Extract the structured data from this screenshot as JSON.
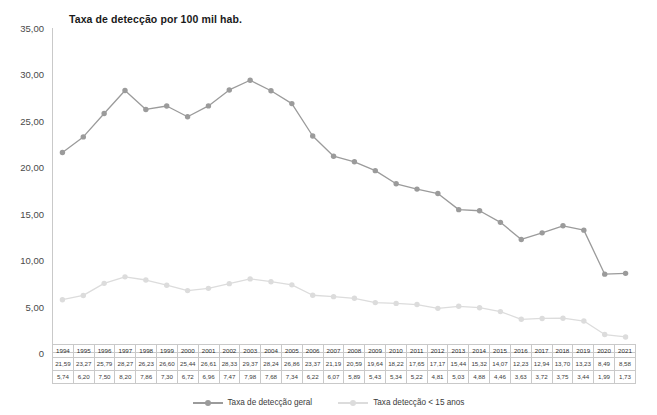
{
  "chart_data": {
    "type": "line",
    "title": "Taxa de detecção por 100 mil hab.",
    "xlabel": "",
    "ylabel": "",
    "ylim": [
      0,
      35
    ],
    "grid": false,
    "legend_position": "bottom",
    "categories": [
      "1994",
      "1995",
      "1996",
      "1997",
      "1998",
      "1999",
      "2000",
      "2001",
      "2002",
      "2003",
      "2004",
      "2005",
      "2006",
      "2007",
      "2008",
      "2009",
      "2010",
      "2011",
      "2012",
      "2013",
      "2014",
      "2015",
      "2016",
      "2017",
      "2018",
      "2019",
      "2020",
      "2021"
    ],
    "y_ticks": [
      "0",
      "5,00",
      "10,00",
      "15,00",
      "20,00",
      "25,00",
      "30,00",
      "35,00"
    ],
    "y_tick_values": [
      0,
      5,
      10,
      15,
      20,
      25,
      30,
      35
    ],
    "series": [
      {
        "name": "Taxa de detecção geral",
        "color": "#9b9b9b",
        "values": [
          21.59,
          23.27,
          25.79,
          28.27,
          26.23,
          26.6,
          25.44,
          26.61,
          28.33,
          29.37,
          28.24,
          26.86,
          23.37,
          21.19,
          20.59,
          19.64,
          18.22,
          17.65,
          17.17,
          15.44,
          15.32,
          14.07,
          12.23,
          12.94,
          13.7,
          13.23,
          8.49,
          8.58
        ],
        "labels": [
          "21,59",
          "23,27",
          "25,79",
          "28,27",
          "26,23",
          "26,60",
          "25,44",
          "26,61",
          "28,33",
          "29,37",
          "28,24",
          "26,86",
          "23,37",
          "21,19",
          "20,59",
          "19,64",
          "18,22",
          "17,65",
          "17,17",
          "15,44",
          "15,32",
          "14,07",
          "12,23",
          "12,94",
          "13,70",
          "13,23",
          "8,49",
          "8,58"
        ]
      },
      {
        "name": "Taxa detecção < 15 anos",
        "color": "#dcdcdc",
        "values": [
          5.74,
          6.2,
          7.5,
          8.2,
          7.86,
          7.3,
          6.72,
          6.96,
          7.47,
          7.98,
          7.68,
          7.34,
          6.22,
          6.07,
          5.89,
          5.43,
          5.34,
          5.22,
          4.81,
          5.03,
          4.88,
          4.46,
          3.63,
          3.72,
          3.75,
          3.44,
          1.99,
          1.73
        ],
        "labels": [
          "5,74",
          "6,20",
          "7,50",
          "8,20",
          "7,86",
          "7,30",
          "6,72",
          "6,96",
          "7,47",
          "7,98",
          "7,68",
          "7,34",
          "6,22",
          "6,07",
          "5,89",
          "5,43",
          "5,34",
          "5,22",
          "4,81",
          "5,03",
          "4,88",
          "4,46",
          "3,63",
          "3,72",
          "3,75",
          "3,44",
          "1,99",
          "1,73"
        ]
      }
    ]
  },
  "legend": {
    "items": [
      {
        "label": "Taxa de detecção geral",
        "color": "#9b9b9b"
      },
      {
        "label": "Taxa detecção < 15 anos",
        "color": "#dcdcdc"
      }
    ]
  },
  "colors": {
    "series_general": "#9b9b9b",
    "series_under15": "#dcdcdc",
    "axis": "#c9c9c9",
    "table_border": "#c9c9c9",
    "text": "#3b3b3b",
    "title": "#1a1a1a",
    "background": "#ffffff"
  }
}
